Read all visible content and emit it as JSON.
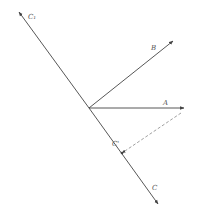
{
  "diagram": {
    "type": "vector-projection",
    "colors": {
      "line": "#444444",
      "dashed": "#888888",
      "label": "#555555",
      "background": "#ffffff"
    },
    "origin": {
      "x": 89,
      "y": 108
    },
    "vectors": [
      {
        "id": "C1",
        "label": "C₁",
        "from": [
          89,
          108
        ],
        "to": [
          19,
          12
        ],
        "label_pos": [
          28,
          19
        ]
      },
      {
        "id": "C",
        "label": "C",
        "from": [
          89,
          108
        ],
        "to": [
          158,
          204
        ],
        "label_pos": [
          152,
          190
        ]
      },
      {
        "id": "B",
        "label": "B",
        "from": [
          89,
          108
        ],
        "to": [
          173,
          41
        ],
        "label_pos": [
          151,
          50
        ]
      },
      {
        "id": "A",
        "label": "A",
        "from": [
          89,
          108
        ],
        "to": [
          184,
          108
        ],
        "label_pos": [
          163,
          105
        ]
      }
    ],
    "projection": {
      "label": "C'",
      "point": [
        122,
        153
      ],
      "dashed_from": [
        181,
        113
      ],
      "label_pos": [
        112,
        146
      ]
    }
  }
}
